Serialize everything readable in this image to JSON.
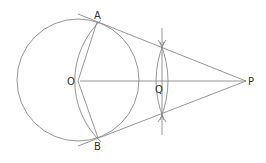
{
  "diagram": {
    "type": "geometry-construction",
    "stroke_color": "#8a8a8a",
    "label_color": "#333333",
    "points": {
      "A": {
        "label": "A",
        "x": 97,
        "y": 22
      },
      "B": {
        "label": "B",
        "x": 98,
        "y": 138
      },
      "O": {
        "label": "O",
        "x": 78,
        "y": 81
      },
      "P": {
        "label": "P",
        "x": 246,
        "y": 81
      },
      "Q": {
        "label": "Q",
        "x": 162,
        "y": 81
      }
    },
    "circle": {
      "cx": 78,
      "cy": 80,
      "r": 61
    },
    "labels": {
      "A": "A",
      "B": "B",
      "O": "O",
      "P": "P",
      "Q": "Q"
    }
  }
}
